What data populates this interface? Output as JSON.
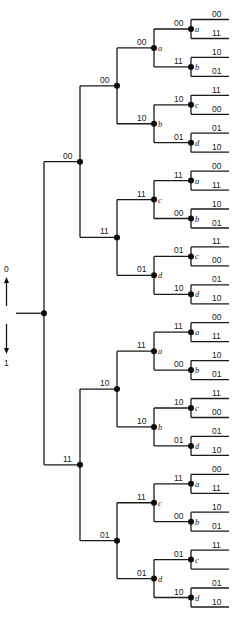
{
  "legend": {
    "up_label": "0",
    "down_label": "1"
  },
  "tree": {
    "type": "trellis-tree",
    "root": {
      "x": 44,
      "y": 316,
      "input_x": 16
    },
    "levels_x": [
      44,
      80,
      117,
      154,
      191,
      229
    ],
    "branch_labels": {
      "level1": [
        "00",
        "11"
      ],
      "level2": [
        "00",
        "11",
        "10",
        "01"
      ],
      "level3": [
        "00",
        "11",
        "10",
        "01",
        "11",
        "00",
        "01",
        "10",
        "11",
        "00",
        "10",
        "01",
        "11",
        "00",
        "01",
        "10"
      ],
      "level4": [
        "00",
        "11",
        "10",
        "01",
        "11",
        "00",
        "01",
        "10",
        "00",
        "11",
        "10",
        "01",
        "11",
        "00",
        "01",
        "10",
        "00",
        "11",
        "10",
        "01",
        "11",
        "00",
        "01",
        "10",
        "00",
        "11",
        "10",
        "01",
        "11",
        "",
        "01",
        "10"
      ]
    },
    "level3_states": [
      "a",
      "b",
      "c",
      "d",
      "a",
      "b",
      "c",
      "d"
    ],
    "level4_states": [
      "a",
      "b",
      "c",
      "d",
      "a",
      "b",
      "c",
      "d",
      "a",
      "b",
      "c",
      "d",
      "a",
      "b",
      "c",
      "d"
    ]
  }
}
